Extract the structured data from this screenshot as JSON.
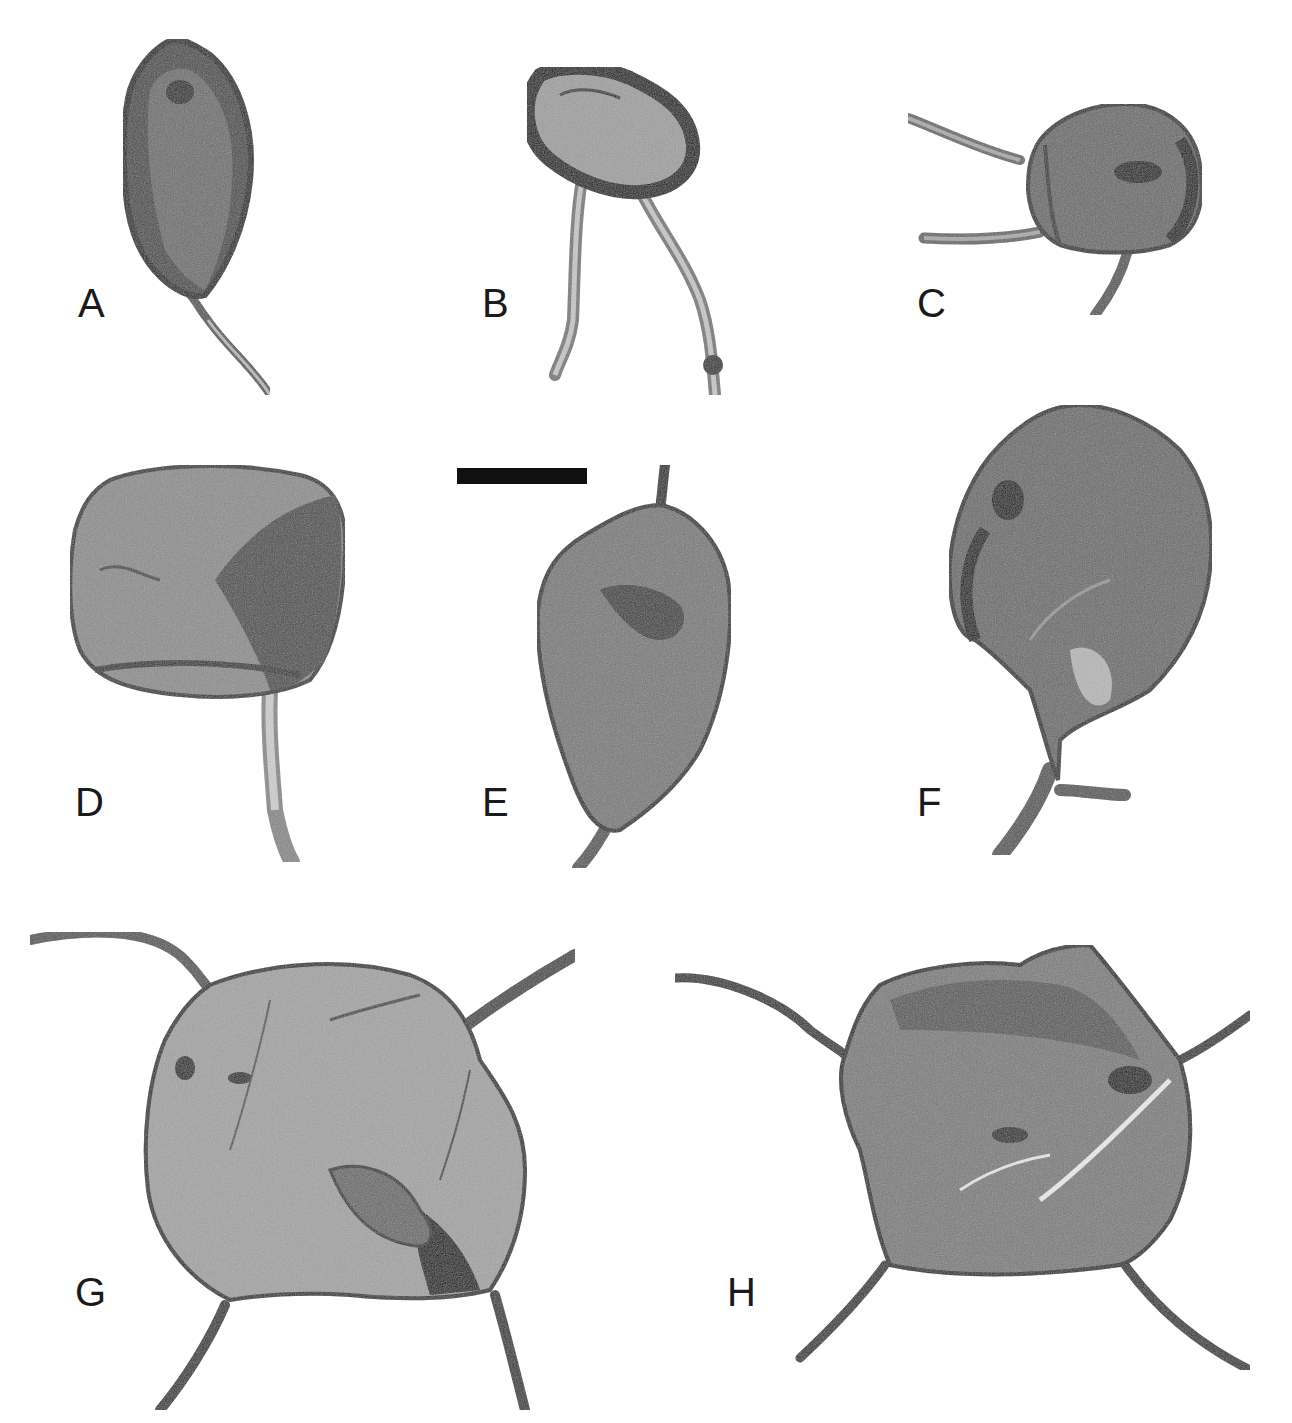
{
  "figure": {
    "type": "microfossil photomicrograph plate",
    "panels": [
      {
        "label": "A",
        "label_pos": [
          78,
          283
        ],
        "description": "elongate spindle-shaped vesicle with dark wall and single tapering process at base"
      },
      {
        "label": "B",
        "label_pos": [
          482,
          283
        ],
        "description": "ovoid vesicle with thick dark rim and two long slender processes"
      },
      {
        "label": "C",
        "label_pos": [
          917,
          283
        ],
        "description": "rounded vesicle with dark inclusion and three processes"
      },
      {
        "label": "D",
        "label_pos": [
          75,
          782
        ],
        "description": "subquadrate vesicle with folds and single basal process"
      },
      {
        "label": "E",
        "label_pos": [
          482,
          782
        ],
        "description": "ovate vesicle with apical short process and tapering basal process"
      },
      {
        "label": "F",
        "label_pos": [
          917,
          782
        ],
        "description": "rounded vesicle with dark spot, tapering into bifurcate basal process"
      },
      {
        "label": "G",
        "label_pos": [
          75,
          1272
        ],
        "description": "large rounded vesicle with four curved processes and fold lines"
      },
      {
        "label": "H",
        "label_pos": [
          727,
          1272
        ],
        "description": "hexagonal vesicle with four long slender processes and fractures"
      }
    ],
    "scale_bar": {
      "x": 457,
      "y": 468,
      "width": 130,
      "height": 16,
      "color": "#111111"
    },
    "colors": {
      "background": "#ffffff",
      "vesicle_fill": "#8a8a8a",
      "vesicle_dark": "#2a2a2a",
      "process_fill": "#9a9a9a",
      "label_text": "#1a1a1a"
    }
  }
}
